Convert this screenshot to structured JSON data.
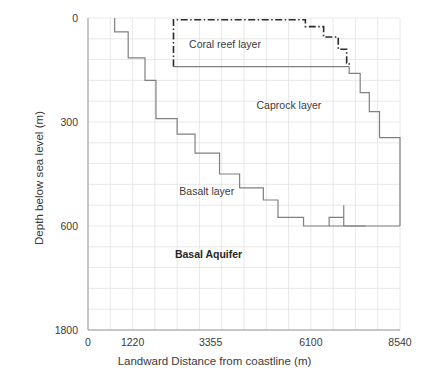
{
  "chart_data": {
    "type": "area",
    "title": "",
    "xlabel": "Landward Distance from coastline (m)",
    "ylabel": "Depth below sea level (m)",
    "xlim": [
      0,
      8540
    ],
    "ylim": [
      0,
      1800
    ],
    "grid": true,
    "legend": "none",
    "x_ticks": [
      {
        "value": 0,
        "label": "0"
      },
      {
        "value": 1220,
        "label": "1220"
      },
      {
        "value": 3355,
        "label": "3355"
      },
      {
        "value": 6100,
        "label": "6100"
      },
      {
        "value": 8540,
        "label": "8540"
      }
    ],
    "y_ticks": [
      {
        "value": 0,
        "label": "0"
      },
      {
        "value": 300,
        "label": "300"
      },
      {
        "value": 600,
        "label": "600"
      },
      {
        "value": 1800,
        "label": "1800"
      }
    ],
    "annotations": [
      {
        "text": "Coral reef layer",
        "x": 3750,
        "y": 75,
        "bold": false
      },
      {
        "text": "Caprock layer",
        "x": 5500,
        "y": 250,
        "bold": false
      },
      {
        "text": "Basalt layer",
        "x": 3250,
        "y": 500,
        "bold": false
      },
      {
        "text": "Basal Aquifer",
        "x": 3300,
        "y": 680,
        "bold": true
      }
    ],
    "series": [
      {
        "name": "Basalt top surface (caprock/basalt contact)",
        "style": "solid",
        "color": "#808080",
        "step": true,
        "points": [
          [
            730,
            0
          ],
          [
            730,
            40
          ],
          [
            1100,
            40
          ],
          [
            1100,
            115
          ],
          [
            1560,
            115
          ],
          [
            1560,
            180
          ],
          [
            1860,
            180
          ],
          [
            1860,
            290
          ],
          [
            2440,
            290
          ],
          [
            2440,
            335
          ],
          [
            2930,
            335
          ],
          [
            2930,
            390
          ],
          [
            3600,
            390
          ],
          [
            3600,
            450
          ],
          [
            4150,
            450
          ],
          [
            4150,
            490
          ],
          [
            4800,
            490
          ],
          [
            4800,
            525
          ],
          [
            5200,
            525
          ],
          [
            5200,
            575
          ],
          [
            5900,
            575
          ],
          [
            5900,
            600
          ],
          [
            6600,
            600
          ]
        ]
      },
      {
        "name": "Caprock base / seaward descending front",
        "style": "solid",
        "color": "#808080",
        "step": true,
        "points": [
          [
            6600,
            600
          ],
          [
            6600,
            575
          ],
          [
            7000,
            575
          ],
          [
            7000,
            540
          ],
          [
            7000,
            600
          ],
          [
            7600,
            600
          ]
        ]
      },
      {
        "name": "Caprock upper surface (solid cap line)",
        "style": "solid",
        "color": "#808080",
        "step": false,
        "points": [
          [
            2340,
            140
          ],
          [
            7150,
            140
          ]
        ]
      },
      {
        "name": "Caprock right flank (stepped descent)",
        "style": "solid",
        "color": "#808080",
        "step": true,
        "points": [
          [
            7150,
            140
          ],
          [
            7150,
            160
          ],
          [
            7450,
            160
          ],
          [
            7450,
            215
          ],
          [
            7700,
            215
          ],
          [
            7700,
            270
          ],
          [
            7980,
            270
          ],
          [
            7980,
            345
          ],
          [
            8540,
            345
          ],
          [
            8540,
            600
          ]
        ]
      },
      {
        "name": "Basal aquifer bottom boundary",
        "style": "solid",
        "color": "#808080",
        "step": false,
        "points": [
          [
            6600,
            600
          ],
          [
            8540,
            600
          ]
        ]
      },
      {
        "name": "Coral reef layer outline",
        "style": "dash-dot",
        "color": "#2b2b2b",
        "step": true,
        "points": [
          [
            2340,
            140
          ],
          [
            2340,
            5
          ],
          [
            5950,
            5
          ],
          [
            5950,
            25
          ],
          [
            6450,
            25
          ],
          [
            6450,
            55
          ],
          [
            6850,
            55
          ],
          [
            6850,
            90
          ],
          [
            7080,
            90
          ],
          [
            7080,
            130
          ],
          [
            7150,
            130
          ],
          [
            7150,
            140
          ]
        ]
      }
    ]
  },
  "axes": {
    "y_title": "Depth below sea level (m)",
    "x_title": "Landward Distance from coastline (m)"
  }
}
